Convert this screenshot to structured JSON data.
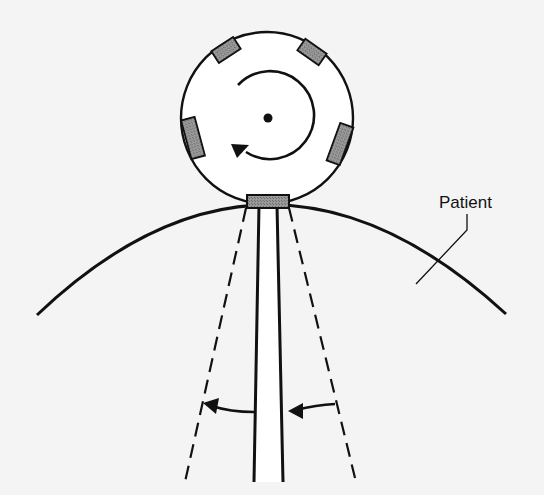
{
  "diagram": {
    "type": "rotating-source-beam-diagram",
    "labels": {
      "patient": "Patient"
    },
    "elements": {
      "gantry_wheel": {
        "shape": "circle",
        "fill": "#ffffff",
        "stroke": "#111111",
        "source_count": 5
      },
      "rotation_arrow": {
        "direction": "clockwise"
      },
      "active_source": {
        "fill": "#8c8c8c"
      },
      "beam": {
        "style": "solid",
        "fill": "#ffffff"
      },
      "beam_extent": {
        "style": "dashed"
      },
      "collimation_arrows": {
        "count": 2,
        "direction": "leftward"
      },
      "patient_surface": {
        "shape": "arc"
      }
    },
    "colors": {
      "background": "#f4f4f4",
      "stroke": "#111111",
      "source_fill": "#8c8c8c"
    }
  }
}
